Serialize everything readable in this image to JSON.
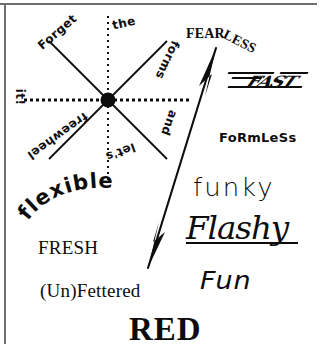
{
  "poster": {
    "title": "RED",
    "background_color": "#ffffff",
    "ink_color": "#0d0d0d",
    "rule_color": "#6e6e72",
    "width": 328,
    "height": 355
  },
  "wheel": {
    "name": "freewheel-diagram",
    "hub_label": "",
    "spokes": [
      {
        "id": "forget",
        "label": "Forget",
        "angle_deg": -41
      },
      {
        "id": "the",
        "label": "the",
        "angle_deg": -13
      },
      {
        "id": "forms",
        "label": "forms",
        "angle_deg": -245
      },
      {
        "id": "and",
        "label": "and",
        "angle_deg": -250
      },
      {
        "id": "lets",
        "label": "let's",
        "angle_deg": -200
      },
      {
        "id": "freewheel",
        "label": "freewheel",
        "angle_deg": -216
      },
      {
        "id": "it",
        "label": "it!",
        "angle_deg": -270
      }
    ],
    "phrase": "Forget the forms and let's freewheel it!"
  },
  "words": {
    "fearless": {
      "head": "FEAR",
      "tail": "LESS",
      "full": "FEARLESS"
    },
    "fast": "FAST",
    "formless": "FoRmLeSs",
    "funky": "funky",
    "flashy": "Flashy",
    "fun": "Fun",
    "flexible": "flexible",
    "fresh": "FRESH",
    "unfettered": "(Un)Fettered",
    "red": "RED"
  },
  "arrow": {
    "name": "double-headed-arrow",
    "from": {
      "x": 148,
      "y": 268
    },
    "to": {
      "x": 216,
      "y": 48
    },
    "heads": "both"
  }
}
